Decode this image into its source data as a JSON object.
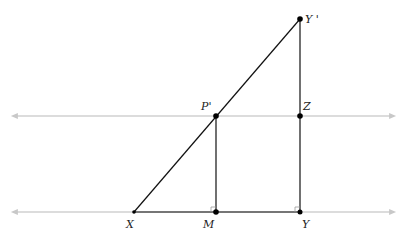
{
  "diagram": {
    "type": "geometry",
    "colors": {
      "segment": "#111111",
      "parallel_line": "#cccccc",
      "point": "#000000"
    },
    "points": {
      "X": {
        "label": "X",
        "x": 134,
        "y": 212
      },
      "M": {
        "label": "M",
        "x": 216,
        "y": 212
      },
      "Y": {
        "label": "Y",
        "x": 300,
        "y": 212
      },
      "P": {
        "label": "P'",
        "x": 216,
        "y": 116
      },
      "Z": {
        "label": "Z",
        "x": 300,
        "y": 116
      },
      "Yp": {
        "label": "Y '",
        "x": 300,
        "y": 19
      }
    },
    "parallel_lines": [
      {
        "name": "upper-line",
        "y": 116,
        "x1": 14,
        "x2": 393
      },
      {
        "name": "lower-line",
        "y": 212,
        "x1": 14,
        "x2": 393
      }
    ],
    "segments": [
      "XY'",
      "XY",
      "MP'",
      "YY'"
    ],
    "right_angles": [
      "M",
      "Y"
    ]
  }
}
